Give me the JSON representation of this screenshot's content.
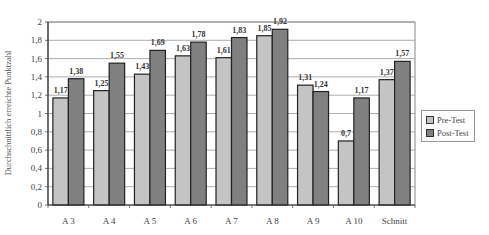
{
  "chart_data": {
    "type": "bar",
    "title": "",
    "xlabel": "",
    "ylabel": "Durchschnittlich erreichte Punktzahl",
    "ylim": [
      0,
      2
    ],
    "yticks": [
      "0",
      "0,2",
      "0,4",
      "0,6",
      "0,8",
      "1",
      "1,2",
      "1,4",
      "1,6",
      "1,8",
      "2"
    ],
    "grid": true,
    "legend_position": "right",
    "categories": [
      "A 3",
      "A 4",
      "A 5",
      "A 6",
      "A 7",
      "A 8",
      "A 9",
      "A 10",
      "Schnitt"
    ],
    "series": [
      {
        "name": "Pre-Test",
        "color": "#c4c4c4",
        "values": [
          1.17,
          1.25,
          1.43,
          1.63,
          1.61,
          1.85,
          1.31,
          0.7,
          1.37
        ],
        "labels": [
          "1,17",
          "1,25",
          "1,43",
          "1,63",
          "1,61",
          "1,85",
          "1,31",
          "0,7",
          "1,37"
        ]
      },
      {
        "name": "Post-Test",
        "color": "#808080",
        "values": [
          1.38,
          1.55,
          1.69,
          1.78,
          1.83,
          1.92,
          1.24,
          1.17,
          1.57
        ],
        "labels": [
          "1,38",
          "1,55",
          "1,69",
          "1,78",
          "1,83",
          "1,92",
          "1,24",
          "1,17",
          "1,57"
        ]
      }
    ]
  },
  "legend": {
    "items": [
      {
        "label": "Pre-Test",
        "color": "#c4c4c4"
      },
      {
        "label": "Post-Test",
        "color": "#808080"
      }
    ]
  }
}
